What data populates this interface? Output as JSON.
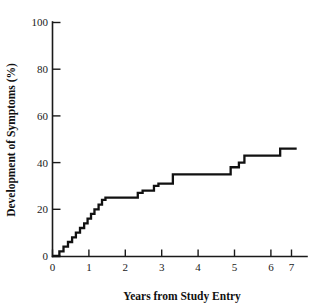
{
  "chart_data": {
    "type": "line",
    "subtype": "step-kaplan-meier-cumulative-incidence",
    "title": "",
    "xlabel": "Years from Study Entry",
    "ylabel": "Development of Symptoms (%)",
    "xlim": [
      0,
      7.4
    ],
    "ylim": [
      0,
      100
    ],
    "grid": false,
    "legend": null,
    "xticks": [
      0,
      1,
      2,
      3,
      4,
      5,
      6,
      7
    ],
    "xtick_labels": [
      "0",
      "1",
      "2",
      "3",
      "4",
      "5",
      "6",
      "7"
    ],
    "yticks": [
      0,
      20,
      40,
      60,
      80,
      100
    ],
    "ytick_labels": [
      "0",
      "20",
      "40",
      "60",
      "80",
      "100"
    ],
    "line_color": "#111111",
    "series": [
      {
        "name": "Cumulative development of symptoms",
        "x": [
          0.0,
          0.2,
          0.2,
          0.32,
          0.32,
          0.45,
          0.45,
          0.57,
          0.57,
          0.68,
          0.68,
          0.8,
          0.8,
          0.92,
          0.92,
          1.02,
          1.02,
          1.12,
          1.12,
          1.22,
          1.22,
          1.34,
          1.34,
          1.44,
          1.44,
          1.54,
          1.54,
          2.48,
          2.48,
          2.62,
          2.62,
          2.95,
          2.95,
          3.08,
          3.08,
          3.5,
          3.5,
          5.18,
          5.18,
          5.42,
          5.42,
          5.58,
          5.58,
          6.62,
          6.62,
          7.1
        ],
        "y": [
          0,
          0,
          2,
          2,
          4,
          4,
          6,
          6,
          8,
          8,
          10,
          10,
          12,
          12,
          14,
          14,
          16,
          16,
          18,
          18,
          20,
          20,
          22,
          22,
          24,
          24,
          25,
          25,
          27,
          27,
          28,
          28,
          30,
          30,
          31,
          31,
          35,
          35,
          38,
          38,
          40,
          40,
          43,
          43,
          46,
          46
        ],
        "step_points": [
          {
            "year": 0.2,
            "pct": 2
          },
          {
            "year": 0.32,
            "pct": 4
          },
          {
            "year": 0.45,
            "pct": 6
          },
          {
            "year": 0.57,
            "pct": 8
          },
          {
            "year": 0.68,
            "pct": 10
          },
          {
            "year": 0.8,
            "pct": 12
          },
          {
            "year": 0.92,
            "pct": 14
          },
          {
            "year": 1.02,
            "pct": 16
          },
          {
            "year": 1.12,
            "pct": 18
          },
          {
            "year": 1.22,
            "pct": 20
          },
          {
            "year": 1.34,
            "pct": 22
          },
          {
            "year": 1.44,
            "pct": 24
          },
          {
            "year": 1.54,
            "pct": 25
          },
          {
            "year": 2.48,
            "pct": 27
          },
          {
            "year": 2.62,
            "pct": 28
          },
          {
            "year": 2.95,
            "pct": 30
          },
          {
            "year": 3.08,
            "pct": 31
          },
          {
            "year": 3.5,
            "pct": 35
          },
          {
            "year": 5.18,
            "pct": 38
          },
          {
            "year": 5.42,
            "pct": 40
          },
          {
            "year": 5.58,
            "pct": 43
          },
          {
            "year": 6.62,
            "pct": 46
          }
        ],
        "final_value": 46
      }
    ]
  }
}
